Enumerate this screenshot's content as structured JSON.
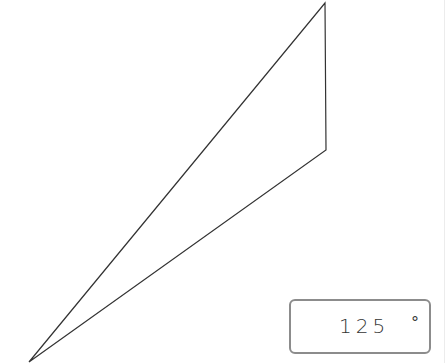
{
  "diagram": {
    "shape": "triangle",
    "vertices": [
      {
        "name": "top",
        "x": 325,
        "y": 3
      },
      {
        "name": "right",
        "x": 326,
        "y": 150
      },
      {
        "name": "bottom-left",
        "x": 29,
        "y": 362
      }
    ],
    "stroke_color": "#333333"
  },
  "angle_input": {
    "value": "125",
    "unit": "°"
  }
}
